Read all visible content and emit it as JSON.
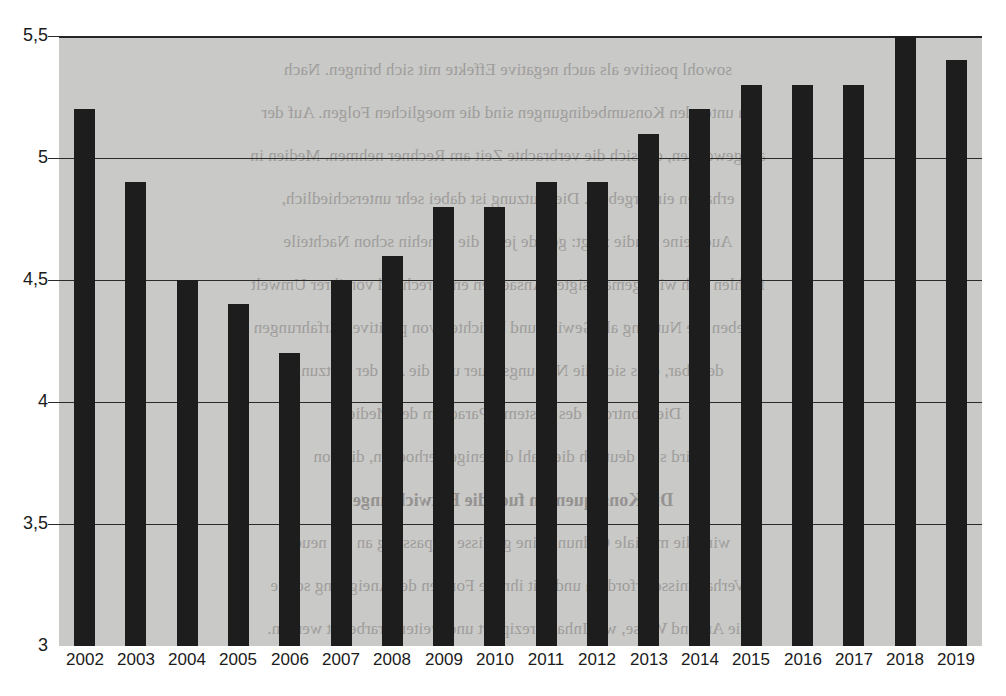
{
  "chart_data": {
    "type": "bar",
    "title": "",
    "subtitle": "",
    "xlabel": "",
    "ylabel": "",
    "categories": [
      "2002",
      "2003",
      "2004",
      "2005",
      "2006",
      "2007",
      "2008",
      "2009",
      "2010",
      "2011",
      "2012",
      "2013",
      "2014",
      "2015",
      "2016",
      "2017",
      "2018",
      "2019"
    ],
    "values": [
      5.2,
      4.9,
      4.5,
      4.4,
      4.2,
      4.5,
      4.6,
      4.8,
      4.8,
      4.9,
      4.9,
      5.1,
      5.2,
      5.3,
      5.3,
      5.3,
      5.5,
      5.4
    ],
    "series": [
      {
        "name": "",
        "values": [
          5.2,
          4.9,
          4.5,
          4.4,
          4.2,
          4.5,
          4.6,
          4.8,
          4.8,
          4.9,
          4.9,
          5.1,
          5.2,
          5.3,
          5.3,
          5.3,
          5.5,
          5.4
        ]
      }
    ],
    "ylim": [
      3,
      5.5
    ],
    "y_ticks": [
      3,
      3.5,
      4,
      4.5,
      5,
      5.5
    ],
    "y_tick_labels": [
      "3",
      "3,5",
      "4",
      "4,5",
      "5",
      "5,5"
    ],
    "grid": true,
    "legend": null,
    "legend_position": "none",
    "annotations": [],
    "bar_color": "#1d1d1d",
    "plot_background_color": "#c9c9c7",
    "figure_background_color": "#ffffff",
    "axis_color": "#2b2b2b"
  },
  "bleed_text": {
    "note": "faint mirrored show-through text from the reverse side of the scanned page",
    "lines": [
      "sowohl positive als auch negative Effekte mit sich bringen. Nach",
      "en unter den Konsumbedingungen sind die moeglichen Folgen. Auf der",
      "als gewonnen, die sich die verbrachte Zeit am Rechner nehmen. Medien in",
      "erhalten ein Ergebnis. Die Nutzung ist dabei sehr unterschiedlich,",
      "Auch eine Studie zeigt: gerade jene, die ohnehin schon Nachteile",
      "fuehlen sich wird gemaessigten Ansaetzen entsprechend von ihrer Umwelt",
      "erleben die Nutzung als Gewinn und berichten von positiven Erfahrungen",
      "denkbar, dass sich die Nutzungsdauer und die Art der Nutzung",
      "Die Kontrolle des Systems. Paradigm der Medien.",
      "wird sich deutlich die Zahl derjenigen erhoehen, die von",
      "Die Konsequenzen fuer die Entwicklungen",
      "wird die mediale Ordnung eine gewisse Anpassung an die neuen",
      "Verhaeltnisse erfordern und mit ihr die Formen der Aneignung sowie",
      "die Art und Weise, wie Inhalte rezipiert und weiterverarbeitet werden."
    ]
  }
}
